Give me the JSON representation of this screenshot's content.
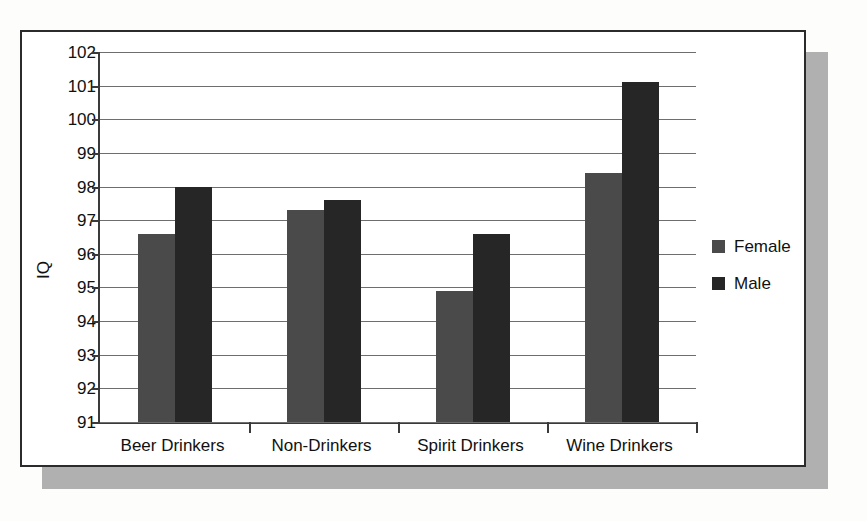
{
  "chart_data": {
    "type": "bar",
    "title": "",
    "xlabel": "",
    "ylabel": "IQ",
    "ylim": [
      91,
      102
    ],
    "ytick_step": 1,
    "yticks": [
      102,
      101,
      100,
      99,
      98,
      97,
      96,
      95,
      94,
      93,
      92,
      91
    ],
    "grid": true,
    "legend_position": "right",
    "categories": [
      "Beer Drinkers",
      "Non-Drinkers",
      "Spirit Drinkers",
      "Wine Drinkers"
    ],
    "series": [
      {
        "name": "Female",
        "color": "#4a4a4a",
        "values": [
          96.6,
          97.3,
          94.9,
          98.4
        ]
      },
      {
        "name": "Male",
        "color": "#262626",
        "values": [
          98.0,
          97.6,
          96.6,
          101.1
        ]
      }
    ]
  },
  "legend": {
    "items": [
      {
        "label": "Female",
        "swatch": "female-swatch-icon"
      },
      {
        "label": "Male",
        "swatch": "male-swatch-icon"
      }
    ]
  },
  "colors": {
    "female": "#4a4a4a",
    "male": "#262626",
    "frame_border": "#2b2b2b",
    "gridline": "#6e6e6e",
    "axis": "#3a3a3a",
    "shadow": "#b0b0b0",
    "panel_background": "#ffffff",
    "page_background": "#fdfdfc",
    "text": "#111111"
  }
}
